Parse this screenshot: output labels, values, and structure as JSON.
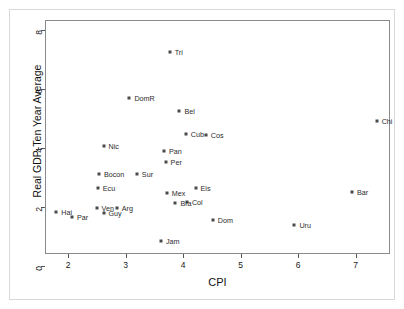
{
  "chart_data": {
    "type": "scatter",
    "title": "",
    "xlabel": "CPI",
    "ylabel": "Real GDP-Ten Year Average",
    "xlim": [
      1.6,
      7.6
    ],
    "ylim": [
      0.4,
      8.35
    ],
    "xticks": [
      2,
      3,
      4,
      5,
      6,
      7
    ],
    "yticks": [
      0,
      2,
      4,
      6,
      8
    ],
    "grid": false,
    "legend": "none",
    "marker_color": "#4a4a4a",
    "points": [
      {
        "label": "Tri",
        "x": 3.75,
        "y": 7.28,
        "lx": 5,
        "ly": -3
      },
      {
        "label": "DomR",
        "x": 3.05,
        "y": 5.73,
        "lx": 5,
        "ly": -3
      },
      {
        "label": "Bel",
        "x": 3.92,
        "y": 5.3,
        "lx": 5,
        "ly": -3
      },
      {
        "label": "Cub",
        "x": 4.03,
        "y": 4.52,
        "lx": 5,
        "ly": -3
      },
      {
        "label": "Cos",
        "x": 4.38,
        "y": 4.48,
        "lx": 5,
        "ly": -3
      },
      {
        "label": "Nic",
        "x": 2.6,
        "y": 4.12,
        "lx": 5,
        "ly": -3
      },
      {
        "label": "Pan",
        "x": 3.65,
        "y": 3.95,
        "lx": 5,
        "ly": -3
      },
      {
        "label": "Per",
        "x": 3.68,
        "y": 3.56,
        "lx": 5,
        "ly": -3
      },
      {
        "label": "Bocon",
        "x": 2.52,
        "y": 3.15,
        "lx": 5,
        "ly": -3
      },
      {
        "label": "Sur",
        "x": 3.18,
        "y": 3.15,
        "lx": 5,
        "ly": -3
      },
      {
        "label": "Ecu",
        "x": 2.5,
        "y": 2.66,
        "lx": 5,
        "ly": -3
      },
      {
        "label": "Eis",
        "x": 4.2,
        "y": 2.67,
        "lx": 5,
        "ly": -3
      },
      {
        "label": "Mex",
        "x": 3.7,
        "y": 2.5,
        "lx": 5,
        "ly": -3
      },
      {
        "label": "Chi",
        "x": 7.35,
        "y": 4.96,
        "lx": 5,
        "ly": -3
      },
      {
        "label": "Bar",
        "x": 6.92,
        "y": 2.54,
        "lx": 5,
        "ly": -3
      },
      {
        "label": "Col",
        "x": 4.05,
        "y": 2.2,
        "lx": 5,
        "ly": -3
      },
      {
        "label": "Bra",
        "x": 3.85,
        "y": 2.15,
        "lx": 5,
        "ly": -3
      },
      {
        "label": "Arg",
        "x": 2.83,
        "y": 2.0,
        "lx": 5,
        "ly": -3
      },
      {
        "label": "Ven",
        "x": 2.48,
        "y": 1.98,
        "lx": 5,
        "ly": -3
      },
      {
        "label": "Hai",
        "x": 1.78,
        "y": 1.85,
        "lx": 5,
        "ly": -3
      },
      {
        "label": "Guy",
        "x": 2.6,
        "y": 1.82,
        "lx": 5,
        "ly": -3
      },
      {
        "label": "Par",
        "x": 2.05,
        "y": 1.68,
        "lx": 5,
        "ly": -3
      },
      {
        "label": "Dom",
        "x": 4.5,
        "y": 1.58,
        "lx": 5,
        "ly": -3
      },
      {
        "label": "Uru",
        "x": 5.92,
        "y": 1.42,
        "lx": 5,
        "ly": -3
      },
      {
        "label": "Jam",
        "x": 3.6,
        "y": 0.88,
        "lx": 5,
        "ly": -3
      }
    ]
  }
}
